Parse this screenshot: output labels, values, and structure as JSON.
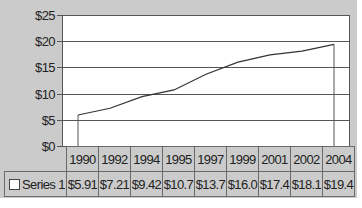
{
  "chart_data": {
    "type": "line",
    "title": "",
    "xlabel": "",
    "ylabel": "",
    "categories": [
      "1990",
      "1992",
      "1994",
      "1995",
      "1997",
      "1999",
      "2001",
      "2002",
      "2004"
    ],
    "series": [
      {
        "name": "Series 1",
        "values": [
          5.91,
          7.21,
          9.42,
          10.7,
          13.7,
          16.0,
          17.4,
          18.1,
          19.4
        ],
        "labels": [
          "$5.91",
          "$7.21",
          "$9.42",
          "$10.7",
          "$13.7",
          "$16.0",
          "$17.4",
          "$18.1",
          "$19.4"
        ],
        "color": "#333333"
      }
    ],
    "y_ticks": [
      "$0",
      "$5",
      "$10",
      "$15",
      "$20",
      "$25"
    ],
    "ylim": [
      0,
      25
    ],
    "grid": true,
    "legend_position": "data-table",
    "data_table": true
  },
  "colors": {
    "chart_background": "#cbcbcb",
    "plot_background": "#ffffff",
    "gridline": "#555555",
    "line": "#333333"
  }
}
